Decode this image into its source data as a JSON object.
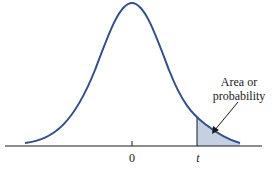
{
  "diagram": {
    "curve": {
      "type": "bell-curve",
      "color": "#2f4f8f",
      "center_label": "0"
    },
    "shaded_region": {
      "from": "t",
      "to": "+inf",
      "fill": "#c5d0e3"
    },
    "axis_labels": {
      "center": "0",
      "critical": "t"
    },
    "annotation": {
      "line1": "Area or",
      "line2": "probability"
    }
  }
}
